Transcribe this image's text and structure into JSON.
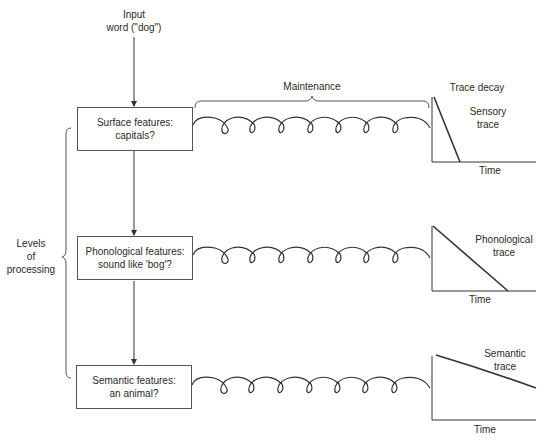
{
  "input": {
    "line1": "Input",
    "line2": "word (\"dog\")"
  },
  "maintenance_label": "Maintenance",
  "trace_decay_label": "Trace decay",
  "levels_label": {
    "line1": "Levels",
    "line2": "of",
    "line3": "processing"
  },
  "levels": [
    {
      "line1": "Surface features:",
      "line2": "capitals?",
      "trace_line1": "Sensory",
      "trace_line2": "trace",
      "axis_label": "Time"
    },
    {
      "line1": "Phonological features:",
      "line2": "sound like 'bog'?",
      "trace_line1": "Phonological",
      "trace_line2": "trace",
      "axis_label": "Time"
    },
    {
      "line1": "Semantic features:",
      "line2": "an animal?",
      "trace_line1": "Semantic",
      "trace_line2": "trace",
      "axis_label": "Time"
    }
  ],
  "colors": {
    "line": "#333333",
    "box_border": "#555555",
    "text": "#2a2a2a"
  }
}
